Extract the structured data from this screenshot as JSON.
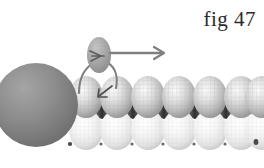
{
  "figure": {
    "caption": "fig 47",
    "caption_color": "#2b2b2b",
    "background_color": "#ffffff",
    "width": 264,
    "height": 168,
    "colors": {
      "cap_sphere_dark": "#8a8a8a",
      "cap_sphere_dark_shadow": "#6d6d6d",
      "upper_sphere_base": "#c3c3c3",
      "upper_sphere_highlight": "#f2f2f2",
      "upper_sphere_shadow": "#8f8f8f",
      "lower_sphere_base": "#ebebeb",
      "lower_sphere_highlight": "#ffffff",
      "lower_sphere_shadow": "#c8c8c8",
      "mesh_line": "#b0b0b0",
      "gap_dark": "#3a3a3a",
      "strand_line": "#7e7e7e",
      "arrow_color": "#808080",
      "detached_sphere_base": "#a9a9a9"
    },
    "cap_sphere": {
      "name": "dark-hemisphere-cap",
      "cx": 36,
      "cy": 105,
      "r": 42,
      "clipped_left": true
    },
    "detached_sphere": {
      "name": "detached-sphere",
      "cx": 99,
      "cy": 55,
      "rx": 12,
      "ry": 18,
      "inner_arrow": "right-chevron"
    },
    "strands": [
      {
        "name": "strand-left",
        "from_x": 91,
        "from_y": 64,
        "to_x": 80,
        "to_y": 92
      },
      {
        "name": "strand-right",
        "from_x": 109,
        "from_y": 64,
        "to_x": 116,
        "to_y": 88
      }
    ],
    "motion_arrow": {
      "name": "motion-arrow-right",
      "x1": 110,
      "y1": 53,
      "x2": 163,
      "y2": 53,
      "direction": "right",
      "label": ""
    },
    "inner_arrows": [
      {
        "name": "detach-arrow-up",
        "direction": "right",
        "x": 99,
        "y": 57
      },
      {
        "name": "reattach-arrow-down-left",
        "direction": "down-left",
        "x": 104,
        "y": 93
      }
    ],
    "upper_row": {
      "name": "upper-sphere-row",
      "count": 7,
      "start_x": 71,
      "spacing": 31,
      "cy": 97,
      "rx": 17,
      "ry": 21
    },
    "lower_row": {
      "name": "lower-sphere-row",
      "count": 7,
      "start_x": 71,
      "spacing": 31,
      "cy": 130,
      "rx": 17,
      "ry": 20
    }
  }
}
